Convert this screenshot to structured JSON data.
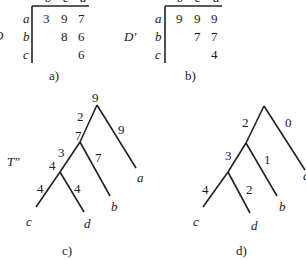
{
  "panel_a": {
    "caption": "a)",
    "side_label": "D",
    "col_headers": [
      "b",
      "c",
      "d"
    ],
    "row_headers": [
      "a",
      "b",
      "c"
    ],
    "rows": [
      [
        "3",
        "9",
        "7"
      ],
      [
        "",
        "8",
        "6"
      ],
      [
        "",
        "",
        "6"
      ]
    ]
  },
  "panel_b": {
    "caption": "b)",
    "side_label": "D′",
    "col_headers": [
      "b",
      "c",
      "d"
    ],
    "row_headers": [
      "a",
      "b",
      "c"
    ],
    "rows": [
      [
        "9",
        "9",
        "9"
      ],
      [
        "",
        "7",
        "7"
      ],
      [
        "",
        "",
        "4"
      ]
    ]
  },
  "panel_c": {
    "caption": "c)",
    "side_label": "T″",
    "node_labels": {
      "root": "9",
      "n1": "7",
      "n2": "4"
    },
    "edge_labels": {
      "root_n1": "2",
      "root_a": "9",
      "n1_n2": "3",
      "n1_b": "7",
      "n2_c": "4",
      "n2_d": "4"
    },
    "leaves": {
      "a": "a",
      "b": "b",
      "c": "c",
      "d": "d"
    }
  },
  "panel_d": {
    "caption": "d)",
    "edge_labels": {
      "root_n1": "2",
      "root_a": "0",
      "n1_n2": "3",
      "n1_b": "1",
      "n2_c": "4",
      "n2_d": "2"
    },
    "leaves": {
      "a": "a",
      "b": "b",
      "c": "c",
      "d": "d"
    }
  }
}
